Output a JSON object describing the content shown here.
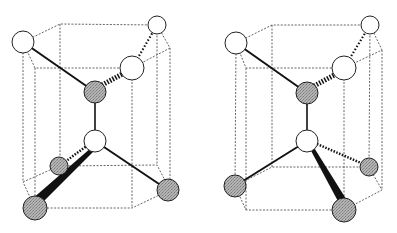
{
  "figure": {
    "colors": {
      "background": "#ffffff",
      "line": "#111111",
      "dashed": "#555555",
      "atom_white": "#ffffff",
      "atom_gray": "#a8a8a8"
    },
    "panels": [
      {
        "id": "left",
        "atoms": [
          {
            "name": "top-left-white",
            "cx": 23,
            "cy": 42,
            "r": 11,
            "fill": "white"
          },
          {
            "name": "top-back-right-white",
            "cx": 157,
            "cy": 25,
            "r": 9,
            "fill": "white"
          },
          {
            "name": "top-front-right-white",
            "cx": 132,
            "cy": 68,
            "r": 12,
            "fill": "white"
          },
          {
            "name": "upper-center-gray",
            "cx": 95,
            "cy": 92,
            "r": 11,
            "fill": "gray"
          },
          {
            "name": "lower-center-white",
            "cx": 95,
            "cy": 141,
            "r": 11,
            "fill": "white"
          },
          {
            "name": "bottom-back-left-gray",
            "cx": 59,
            "cy": 166,
            "r": 9,
            "fill": "gray"
          },
          {
            "name": "bottom-front-left-gray",
            "cx": 35,
            "cy": 208,
            "r": 12,
            "fill": "gray"
          },
          {
            "name": "bottom-right-gray",
            "cx": 168,
            "cy": 190,
            "r": 11,
            "fill": "gray"
          }
        ]
      },
      {
        "id": "right",
        "atoms": [
          {
            "name": "top-left-white",
            "cx": 236,
            "cy": 43,
            "r": 11,
            "fill": "white"
          },
          {
            "name": "top-back-right-white",
            "cx": 370,
            "cy": 25,
            "r": 9,
            "fill": "white"
          },
          {
            "name": "top-front-right-white",
            "cx": 344,
            "cy": 68,
            "r": 12,
            "fill": "white"
          },
          {
            "name": "upper-center-gray",
            "cx": 307,
            "cy": 93,
            "r": 11,
            "fill": "gray"
          },
          {
            "name": "lower-center-white",
            "cx": 307,
            "cy": 141,
            "r": 11,
            "fill": "white"
          },
          {
            "name": "bottom-left-gray",
            "cx": 235,
            "cy": 186,
            "r": 11,
            "fill": "gray"
          },
          {
            "name": "bottom-back-right-gray",
            "cx": 369,
            "cy": 167,
            "r": 9,
            "fill": "gray"
          },
          {
            "name": "bottom-front-gray",
            "cx": 344,
            "cy": 210,
            "r": 12,
            "fill": "gray"
          }
        ]
      }
    ]
  }
}
